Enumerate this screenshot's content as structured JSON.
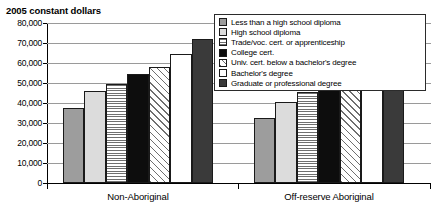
{
  "chart_data": {
    "type": "bar",
    "title": "2005 constant dollars",
    "xlabel": "",
    "ylabel": "2005 constant dollars",
    "ylim": [
      0,
      80000
    ],
    "ytick_labels": [
      "0",
      "10,000",
      "20,000",
      "30,000",
      "40,000",
      "50,000",
      "60,000",
      "70,000",
      "80,000"
    ],
    "ytick_values": [
      0,
      10000,
      20000,
      30000,
      40000,
      50000,
      60000,
      70000,
      80000
    ],
    "grid": true,
    "legend_position": "top-right",
    "categories": [
      "Non-Aboriginal",
      "Off-reserve Aboriginal"
    ],
    "series": [
      {
        "name": "Less than a high school diploma",
        "fill": "fill-midgray",
        "values": [
          37500,
          32500
        ]
      },
      {
        "name": "High school diploma",
        "fill": "fill-lightgray",
        "values": [
          46000,
          40500
        ]
      },
      {
        "name": "Trade/voc. cert. or apprenticeship",
        "fill": "fill-hstripe",
        "values": [
          49500,
          45500
        ]
      },
      {
        "name": "College cert.",
        "fill": "fill-black",
        "values": [
          54500,
          49500
        ]
      },
      {
        "name": "Univ. cert. below a bachelor's degree",
        "fill": "fill-diag",
        "values": [
          58000,
          52500
        ]
      },
      {
        "name": "Bachelor's degree",
        "fill": "fill-white",
        "values": [
          64500,
          57500
        ]
      },
      {
        "name": "Graduate or professional degree",
        "fill": "fill-darkgray",
        "values": [
          72000,
          66500
        ]
      }
    ]
  }
}
